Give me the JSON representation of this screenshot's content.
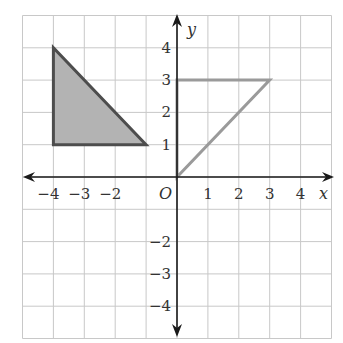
{
  "diagram": {
    "type": "coordinate_plane",
    "grid": {
      "xmin": -5,
      "xmax": 5,
      "ymin": -5,
      "ymax": 5,
      "step": 1
    },
    "axes": {
      "x_label": "x",
      "y_label": "y",
      "origin_label": "O"
    },
    "x_tick_labels": [
      {
        "value": -4,
        "text": "−4"
      },
      {
        "value": -3,
        "text": "−3"
      },
      {
        "value": -2,
        "text": "−2"
      },
      {
        "value": 1,
        "text": "1"
      },
      {
        "value": 2,
        "text": "2"
      },
      {
        "value": 3,
        "text": "3"
      },
      {
        "value": 4,
        "text": "4"
      }
    ],
    "y_tick_labels": [
      {
        "value": 4,
        "text": "4"
      },
      {
        "value": 3,
        "text": "3"
      },
      {
        "value": 2,
        "text": "2"
      },
      {
        "value": 1,
        "text": "1"
      },
      {
        "value": -2,
        "text": "−2"
      },
      {
        "value": -3,
        "text": "−3"
      },
      {
        "value": -4,
        "text": "−4"
      }
    ],
    "shapes": [
      {
        "name": "shaded-triangle",
        "vertices": [
          [
            -4,
            4
          ],
          [
            -4,
            1
          ],
          [
            -1,
            1
          ]
        ],
        "fill": "#b3b3b3",
        "stroke": "#4d4d4d"
      },
      {
        "name": "outline-triangle",
        "vertices": [
          [
            0,
            0
          ],
          [
            0,
            3
          ],
          [
            3,
            3
          ]
        ],
        "fill": "none",
        "stroke": "#9a9a9a"
      }
    ]
  }
}
